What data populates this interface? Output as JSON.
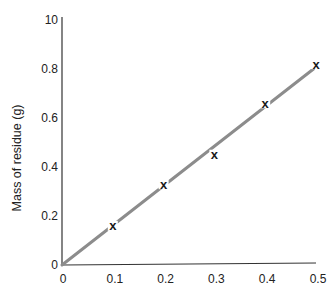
{
  "chart_data": {
    "type": "scatter",
    "title": "",
    "xlabel": "",
    "ylabel": "Mass of residue (g)",
    "xlim": [
      0,
      0.5
    ],
    "ylim": [
      0,
      1.0
    ],
    "x_ticks": [
      0,
      0.1,
      0.2,
      0.3,
      0.4,
      0.5
    ],
    "x_tick_labels": [
      "0",
      "0.1",
      "0.2",
      "0.3",
      "0.4",
      "0.5"
    ],
    "y_ticks": [
      0,
      0.2,
      0.4,
      0.6,
      0.8,
      1.0
    ],
    "y_tick_labels": [
      "0",
      "0.2",
      "0.4",
      "0.6",
      "0.8",
      "10"
    ],
    "grid": false,
    "legend": null,
    "series": [
      {
        "name": "Measured points",
        "marker": "x",
        "x": [
          0.1,
          0.2,
          0.3,
          0.4,
          0.5
        ],
        "y": [
          0.16,
          0.33,
          0.45,
          0.66,
          0.82
        ]
      },
      {
        "name": "Best-fit line",
        "style": "line",
        "x": [
          0,
          0.495
        ],
        "y": [
          0,
          0.8
        ]
      }
    ],
    "colors": {
      "axis": "#333333",
      "fit_line": "#8c8c8c",
      "marker": "#1a1a1a",
      "text": "#222222"
    }
  }
}
